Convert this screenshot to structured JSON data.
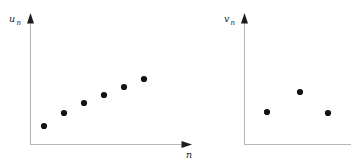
{
  "figure": {
    "background_color": "#ffffff",
    "axis_color": "#b9b9b9",
    "point_color": "#131313",
    "arrow_color": "#1d1d1d"
  },
  "panels": [
    {
      "name": "left-panel",
      "y_axis_label": "u",
      "y_axis_label_sub": "n",
      "x_axis_label": "n",
      "x_axis_label_sub": "",
      "has_x_arrow": true,
      "has_y_arrow": true
    },
    {
      "name": "right-panel",
      "y_axis_label": "v",
      "y_axis_label_sub": "n",
      "x_axis_label": "",
      "x_axis_label_sub": "",
      "has_x_arrow": false,
      "has_y_arrow": true
    }
  ],
  "chart_data": [
    {
      "type": "scatter",
      "title": "",
      "xlabel": "n",
      "ylabel": "u_n",
      "grid": false,
      "legend": "none",
      "n_points": 6,
      "x": [
        1,
        2,
        3,
        4,
        5,
        6
      ],
      "y": [
        1.0,
        1.65,
        2.15,
        2.55,
        2.95,
        3.35
      ],
      "pixel_points": [
        {
          "cx": 44,
          "cy": 126
        },
        {
          "cx": 64,
          "cy": 113
        },
        {
          "cx": 84,
          "cy": 103
        },
        {
          "cx": 104,
          "cy": 95
        },
        {
          "cx": 124,
          "cy": 87
        },
        {
          "cx": 144,
          "cy": 79
        }
      ],
      "point_radius": 3.1,
      "description": "increasing sequence"
    },
    {
      "type": "scatter",
      "title": "",
      "xlabel": "",
      "ylabel": "v_n",
      "grid": false,
      "legend": "none",
      "n_points": 3,
      "x": [
        1,
        2,
        3
      ],
      "y": [
        1.6,
        2.6,
        1.55
      ],
      "pixel_points": [
        {
          "cx": 267,
          "cy": 112
        },
        {
          "cx": 300,
          "cy": 92
        },
        {
          "cx": 328,
          "cy": 113
        }
      ],
      "point_radius": 3.1,
      "description": "non-monotonic sequence"
    }
  ]
}
